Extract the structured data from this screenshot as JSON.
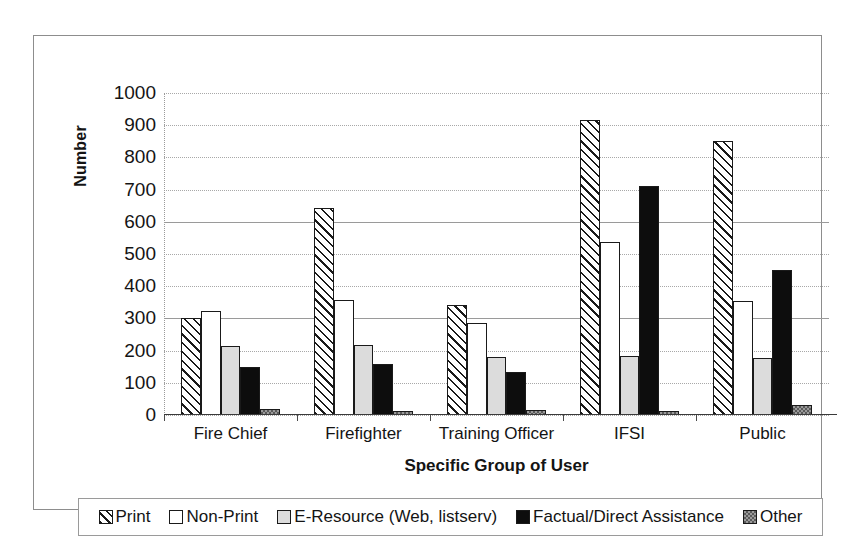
{
  "chart_data": {
    "type": "bar",
    "title": "",
    "xlabel": "Specific Group of User",
    "ylabel": "Number",
    "categories": [
      "Fire Chief",
      "Firefighter",
      "Training Officer",
      "IFSI",
      "Public"
    ],
    "series": [
      {
        "name": "Print",
        "values": [
          300,
          643,
          342,
          915,
          852
        ],
        "fill": "diagonal-hatch",
        "color": "#1a1a1a"
      },
      {
        "name": "Non-Print",
        "values": [
          322,
          358,
          285,
          538,
          355
        ],
        "fill": "white",
        "color": "#ffffff"
      },
      {
        "name": "E-Resource (Web, listserv)",
        "values": [
          215,
          218,
          180,
          182,
          178
        ],
        "fill": "light-gray",
        "color": "#dcdcdc"
      },
      {
        "name": "Factual/Direct Assistance",
        "values": [
          148,
          158,
          133,
          710,
          450
        ],
        "fill": "solid-black",
        "color": "#0d0d0d"
      },
      {
        "name": "Other",
        "values": [
          18,
          14,
          15,
          12,
          30
        ],
        "fill": "checker-gray",
        "color": "#9a9a9a"
      }
    ],
    "ylim": [
      0,
      1000
    ],
    "ytick_step": 100,
    "yticks": [
      1000,
      900,
      800,
      700,
      600,
      500,
      400,
      300,
      200,
      100,
      0
    ],
    "grid": true,
    "legend_position": "bottom"
  },
  "legend": {
    "items": [
      {
        "label": "Print"
      },
      {
        "label": "Non-Print"
      },
      {
        "label": "E-Resource (Web, listserv)"
      },
      {
        "label": "Factual/Direct Assistance"
      },
      {
        "label": "Other"
      }
    ]
  },
  "colors": {
    "frame": "#8d8d8d",
    "gridline": "#a8a8a8",
    "axis": "#3a3a3a",
    "text": "#141414"
  }
}
